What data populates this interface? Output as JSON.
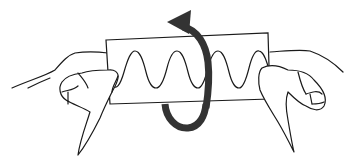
{
  "figure": {
    "description": "Two hands hold a rectangular strip of paper with a sine wave drawn on it; a thick curved arrow loops around the strip indicating rotation about a vertical axis",
    "elements": {
      "paper_strip": "rectangular strip",
      "wave": "sine wave, 4 peaks",
      "arrow": "curved rotation arrow, counter-clockwise when viewed from above",
      "hands": [
        "left hand",
        "right hand"
      ]
    },
    "colors": {
      "line": "#1a1a1a",
      "arrow": "#333333",
      "background": "#ffffff"
    }
  }
}
